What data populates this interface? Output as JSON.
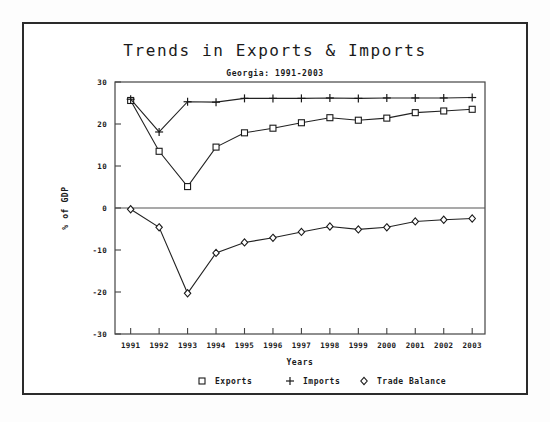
{
  "chart_data": {
    "type": "line",
    "title": "Trends in Exports & Imports",
    "subtitle": "Georgia: 1991-2003",
    "xlabel": "Years",
    "ylabel": "% of GDP",
    "categories": [
      "1991",
      "1992",
      "1993",
      "1994",
      "1995",
      "1996",
      "1997",
      "1998",
      "1999",
      "2000",
      "2001",
      "2002",
      "2003"
    ],
    "x": [
      1991,
      1992,
      1993,
      1994,
      1995,
      1996,
      1997,
      1998,
      1999,
      2000,
      2001,
      2002,
      2003
    ],
    "ylim": [
      -30,
      30
    ],
    "yticks": [
      30,
      20,
      10,
      0,
      -10,
      -20,
      -30
    ],
    "ytick_labels": [
      "30",
      "20",
      "10",
      "0",
      "-10",
      "-20",
      "-30"
    ],
    "grid": false,
    "legend_position": "bottom",
    "series": [
      {
        "name": "Exports",
        "marker": "square",
        "values": [
          25.6,
          13.5,
          5.1,
          14.5,
          17.9,
          19.0,
          20.3,
          21.5,
          20.9,
          21.4,
          22.7,
          23.1,
          23.5
        ]
      },
      {
        "name": "Imports",
        "marker": "plus",
        "values": [
          25.9,
          18.1,
          25.3,
          25.2,
          26.1,
          26.1,
          26.1,
          26.2,
          26.1,
          26.2,
          26.2,
          26.2,
          26.3
        ]
      },
      {
        "name": "Trade Balance",
        "marker": "diamond",
        "values": [
          -0.3,
          -4.6,
          -20.3,
          -10.7,
          -8.2,
          -7.1,
          -5.7,
          -4.4,
          -5.1,
          -4.6,
          -3.2,
          -2.8,
          -2.5
        ]
      }
    ]
  },
  "legend": {
    "items": [
      {
        "symbol": "square",
        "label": "Exports"
      },
      {
        "symbol": "plus",
        "label": "Imports"
      },
      {
        "symbol": "diamond",
        "label": "Trade Balance"
      }
    ]
  },
  "colors": {
    "ink": "#1a1a1a",
    "axis": "#444444",
    "frame": "#2b2b2b",
    "background": "#ffffff"
  }
}
